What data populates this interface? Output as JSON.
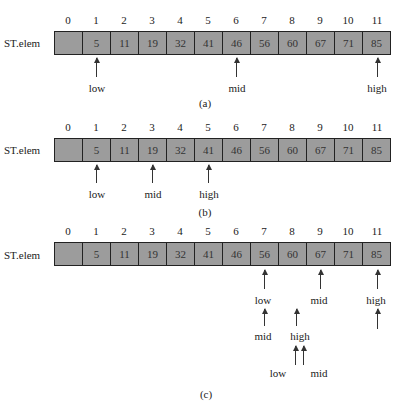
{
  "array": {
    "name": "ST.elem",
    "indices": [
      "0",
      "1",
      "2",
      "3",
      "4",
      "5",
      "6",
      "7",
      "8",
      "9",
      "10",
      "11"
    ],
    "values": [
      "",
      "5",
      "11",
      "19",
      "32",
      "41",
      "46",
      "56",
      "60",
      "67",
      "71",
      "85"
    ],
    "fill_color": "#9c9c9c",
    "border_color": "#222222"
  },
  "panels": [
    {
      "caption": "(a)",
      "pointers": [
        {
          "label": "low",
          "index": 1
        },
        {
          "label": "mid",
          "index": 6
        },
        {
          "label": "high",
          "index": 11
        }
      ]
    },
    {
      "caption": "(b)",
      "pointers": [
        {
          "label": "low",
          "index": 1
        },
        {
          "label": "mid",
          "index": 3
        },
        {
          "label": "high",
          "index": 5
        }
      ]
    },
    {
      "caption": "(c)",
      "pointers": [
        {
          "label": "low",
          "index": 7
        },
        {
          "label": "mid",
          "index": 9
        },
        {
          "label": "high",
          "index": 11
        },
        {
          "label": "mid",
          "index": 7,
          "level": 2
        },
        {
          "label": "high",
          "index": 8,
          "level": 2
        },
        {
          "label": "low",
          "index": 8,
          "level": 3
        },
        {
          "label": "mid",
          "index": 8,
          "level": 3
        }
      ]
    }
  ]
}
